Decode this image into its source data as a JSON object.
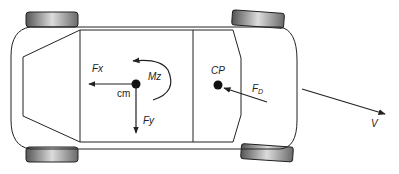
{
  "diagram": {
    "type": "vehicle free-body diagram (top view)",
    "labels": {
      "fx": "Fx",
      "fy": "Fy",
      "mz": "Mz",
      "cm": "cm",
      "cp": "CP",
      "fd_main": "F",
      "fd_sub": "D",
      "v": "V"
    },
    "elements": [
      {
        "id": "car-body",
        "kind": "rounded-rectangle outline"
      },
      {
        "id": "cabin",
        "kind": "octagonal cabin outline"
      },
      {
        "id": "wheel-front-left",
        "position": "top-left"
      },
      {
        "id": "wheel-front-right",
        "position": "top-right, angled"
      },
      {
        "id": "wheel-rear-left",
        "position": "bottom-left"
      },
      {
        "id": "wheel-rear-right",
        "position": "bottom-right, angled"
      },
      {
        "id": "center-of-mass",
        "label": "cm"
      },
      {
        "id": "center-of-pressure",
        "label": "CP"
      },
      {
        "id": "force-fx",
        "direction": "left"
      },
      {
        "id": "force-fy",
        "direction": "down"
      },
      {
        "id": "moment-mz",
        "direction": "counter-clockwise arc"
      },
      {
        "id": "drag-force-fd",
        "direction": "toward CP from lower-right"
      },
      {
        "id": "velocity-v",
        "direction": "lower-right"
      }
    ],
    "colors": {
      "line": "#222222",
      "wheel_dark": "#555555",
      "wheel_light": "#d8d8d8"
    }
  }
}
